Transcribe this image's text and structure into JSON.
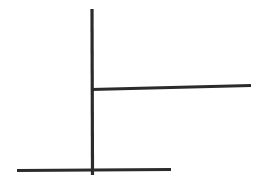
{
  "canvas": {
    "width": 264,
    "height": 186,
    "background_color": "#ffffff",
    "description": "hand-drawn-line-figure"
  },
  "figure": {
    "name": "three-stroke-line-figure",
    "stroke_color": "#2b2b2b",
    "strokes": [
      {
        "id": "vertical-stem",
        "name": "vertical-line",
        "orientation": "vertical",
        "x1": 92.0,
        "y1": 9.0,
        "x2": 92.5,
        "y2": 175.0,
        "width": 3.2,
        "color": "#2b2b2b"
      },
      {
        "id": "middle-crossbar",
        "name": "middle-horizontal-line",
        "orientation": "horizontal",
        "x1": 91.0,
        "y1": 89.5,
        "x2": 251.0,
        "y2": 85.5,
        "width": 3.0,
        "color": "#2b2b2b"
      },
      {
        "id": "bottom-crossbar",
        "name": "bottom-horizontal-line",
        "orientation": "horizontal",
        "x1": 17.0,
        "y1": 170.5,
        "x2": 171.0,
        "y2": 169.5,
        "width": 3.0,
        "color": "#2b2b2b"
      }
    ],
    "junctions": [
      {
        "name": "upper-t-junction",
        "x": 92,
        "y": 89,
        "type": "tee-right"
      },
      {
        "name": "lower-cross-junction",
        "x": 92,
        "y": 170,
        "type": "cross"
      }
    ]
  }
}
